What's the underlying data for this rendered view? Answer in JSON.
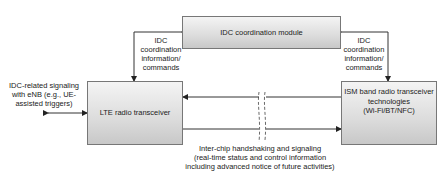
{
  "diagram": {
    "nodes": {
      "idc_module": {
        "label": "IDC coordination module"
      },
      "lte": {
        "label": "LTE radio transceiver"
      },
      "ism": {
        "label_lines": [
          "ISM band radio transceiver",
          "technologies",
          "(Wi-Fi/BT/NFC)"
        ]
      }
    },
    "edges": {
      "idc_to_lte": {
        "label_lines": [
          "IDC",
          "coordination",
          "information/",
          "commands"
        ]
      },
      "idc_to_ism": {
        "label_lines": [
          "IDC",
          "coordination",
          "information/",
          "commands"
        ]
      },
      "enb_signaling": {
        "label_lines": [
          "IDC-related signaling",
          "with eNB (e.g., UE-",
          "assisted triggers)"
        ]
      },
      "inter_chip": {
        "label_lines": [
          "Inter-chip handshaking and signaling",
          "(real-time status and control information",
          "including advanced notice of future activities)"
        ]
      }
    },
    "colors": {
      "box_border": "#777777",
      "box_fill_top": "#f4f4f4",
      "box_fill_bottom": "#c8c8c8",
      "line": "#333333"
    }
  }
}
